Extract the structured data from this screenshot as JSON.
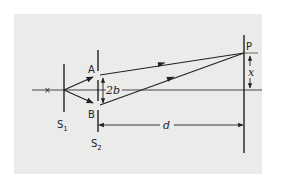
{
  "diagram": {
    "labels": {
      "slit_a": "A",
      "slit_b": "B",
      "separation": "2b",
      "first_slit": "S",
      "first_slit_sub": "1",
      "second_slit": "S",
      "second_slit_sub": "2",
      "screen_point": "P",
      "offset": "x",
      "distance": "d"
    },
    "colors": {
      "ink": "#222222",
      "panel": "#ebebea",
      "background": "#ffffff"
    }
  }
}
